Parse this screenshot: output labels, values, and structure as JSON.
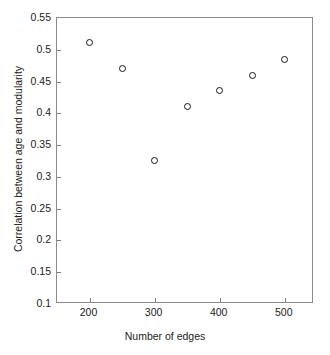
{
  "chart_data": {
    "type": "scatter",
    "title": "",
    "xlabel": "Number of edges",
    "ylabel": "Correlation between age and modularity",
    "xlim": [
      150,
      545
    ],
    "ylim": [
      0.1,
      0.55
    ],
    "grid": false,
    "legend": null,
    "marker_style": "open-circle",
    "marker_color": "#151515",
    "x": [
      200,
      250,
      300,
      350,
      400,
      450,
      500
    ],
    "values": [
      0.512,
      0.47,
      0.326,
      0.41,
      0.436,
      0.46,
      0.484
    ],
    "points": [
      {
        "x": 200,
        "y": 0.512
      },
      {
        "x": 250,
        "y": 0.47
      },
      {
        "x": 300,
        "y": 0.326
      },
      {
        "x": 350,
        "y": 0.41
      },
      {
        "x": 400,
        "y": 0.436
      },
      {
        "x": 450,
        "y": 0.46
      },
      {
        "x": 500,
        "y": 0.484
      }
    ],
    "xticks": [
      200,
      300,
      400,
      500
    ],
    "xtick_labels": [
      "200",
      "300",
      "400",
      "500"
    ],
    "yticks": [
      0.1,
      0.15,
      0.2,
      0.25,
      0.3,
      0.35,
      0.4,
      0.45,
      0.5,
      0.55
    ],
    "ytick_labels": [
      "0.1",
      "0.15",
      "0.2",
      "0.25",
      "0.3",
      "0.35",
      "0.4",
      "0.45",
      "0.5",
      "0.55"
    ]
  },
  "colors": {
    "background": "#ffffff",
    "axis": "#8a8a8a",
    "text": "#1c1c1c",
    "marker": "#151515"
  }
}
